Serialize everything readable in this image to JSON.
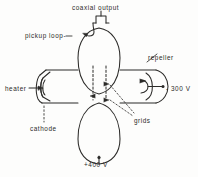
{
  "figure": {
    "type": "schematic-diagram",
    "background_color": "#fdfdfc",
    "ink_color": "#2b2a28",
    "width": 198,
    "height": 177
  },
  "labels": {
    "coaxial_output": "coaxial output",
    "pickup_loop": "pickup loop-",
    "repeller": "repeller",
    "heater": "heater",
    "cathode": "cathode",
    "grids": "grids",
    "repeller_voltage": "- 300 V",
    "anode_voltage": "+400 V"
  },
  "parts": [
    {
      "name": "coaxial-output",
      "label": "coaxial output",
      "position": "top",
      "leader": "vertical-line-to-connector"
    },
    {
      "name": "pickup-loop",
      "label": "pickup loop-",
      "position": "top-left",
      "leader": "dash-to-loop"
    },
    {
      "name": "repeller",
      "label": "repeller",
      "position": "right",
      "leader": "diagonal-line"
    },
    {
      "name": "heater",
      "label": "heater",
      "position": "left",
      "leader": "arrow-right"
    },
    {
      "name": "cathode",
      "label": "cathode",
      "position": "bottom-left",
      "leader": "dashed-vertical"
    },
    {
      "name": "grids",
      "label": "grids",
      "position": "center-right",
      "leader": "dashed-arrows"
    }
  ],
  "terminals": [
    {
      "name": "repeller-terminal",
      "value": "- 300 V",
      "position": "right",
      "marker": "dot"
    },
    {
      "name": "anode-terminal",
      "value": "+400 V",
      "position": "bottom",
      "marker": "dot"
    }
  ]
}
